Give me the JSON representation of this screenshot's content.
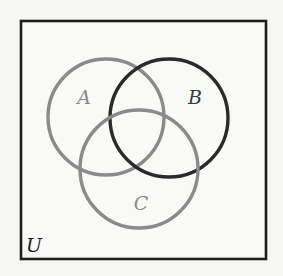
{
  "diagram": {
    "type": "venn",
    "universe": {
      "label": "U",
      "box": {
        "x": 21,
        "y": 21,
        "width": 245,
        "height": 238
      },
      "stroke": "#1e1e1e",
      "label_pos": {
        "x": 26,
        "y": 252
      }
    },
    "sets": [
      {
        "name": "A",
        "label": "A",
        "cx": 106,
        "cy": 117,
        "r": 58,
        "stroke": "#8a8a8a",
        "label_color": "#8a8a8a",
        "label_pos": {
          "x": 84,
          "y": 104
        }
      },
      {
        "name": "B",
        "label": "B",
        "cx": 169,
        "cy": 118,
        "r": 59,
        "stroke": "#2a2a2a",
        "label_color": "#3a3a3a",
        "label_pos": {
          "x": 195,
          "y": 104
        }
      },
      {
        "name": "C",
        "label": "C",
        "cx": 139,
        "cy": 169,
        "r": 59,
        "stroke": "#8a8a8a",
        "label_color": "#8a8a8a",
        "label_pos": {
          "x": 141,
          "y": 210
        }
      }
    ]
  }
}
